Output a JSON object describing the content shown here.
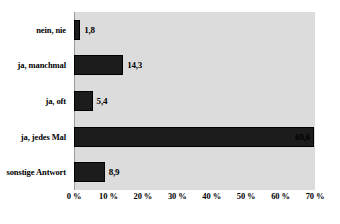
{
  "chart_data": {
    "type": "bar",
    "orientation": "horizontal",
    "title": "",
    "subtitle": "",
    "xlabel": "",
    "ylabel": "",
    "categories": [
      "nein, nie",
      "ja, manchmal",
      "ja, oft",
      "ja, jedes Mal",
      "sonstige Antwort"
    ],
    "values": [
      1.8,
      14.3,
      5.4,
      69.6,
      8.9
    ],
    "value_labels": [
      "1,8",
      "14,3",
      "5,4",
      "69,6",
      "8,9"
    ],
    "xlim": [
      0,
      70
    ],
    "xticks": [
      0,
      10,
      20,
      30,
      40,
      50,
      60,
      70
    ],
    "xtick_labels": [
      "0 %",
      "10 %",
      "20 %",
      "30 %",
      "40 %",
      "50 %",
      "60 %",
      "70 %"
    ],
    "grid": false,
    "legend": null,
    "series": [
      {
        "name": "Anteil",
        "values": [
          1.8,
          14.3,
          5.4,
          69.6,
          8.9
        ]
      }
    ],
    "colors": {
      "bar": "#1c1c1c",
      "bar_border": "#000000",
      "plot_background": "#dcdcdc",
      "page_background": "#ffffff",
      "text": "#000000"
    }
  }
}
